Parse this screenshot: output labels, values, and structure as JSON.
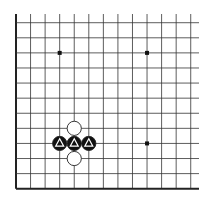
{
  "board": {
    "label": "Go board diagram (lower-left corner fragment)",
    "background": "#ffffff",
    "line_color": "#333333",
    "edge_color": "#222222",
    "origin_x": 16,
    "origin_y": 188.7,
    "spacing_x": 14.56,
    "spacing_y": 15.09,
    "columns": 13,
    "rows": 12,
    "top_extent_y": 14,
    "right_extent_x": 199,
    "edges": [
      "left",
      "bottom"
    ]
  },
  "star_points": [
    {
      "col": 3,
      "row": 9
    },
    {
      "col": 9,
      "row": 9
    },
    {
      "col": 9,
      "row": 3
    },
    {
      "col": 3,
      "row": 3
    }
  ],
  "stones": [
    {
      "color": "white",
      "col": 4,
      "row": 4,
      "marker": "none"
    },
    {
      "color": "black",
      "col": 3,
      "row": 3,
      "marker": "triangle"
    },
    {
      "color": "black",
      "col": 4,
      "row": 3,
      "marker": "triangle"
    },
    {
      "color": "black",
      "col": 5,
      "row": 3,
      "marker": "triangle"
    },
    {
      "color": "white",
      "col": 4,
      "row": 2,
      "marker": "none"
    }
  ],
  "colors": {
    "black_stone": "#111111",
    "white_stone": "#ffffff",
    "stone_outline": "#222222",
    "marker_on_black": "#ffffff"
  }
}
